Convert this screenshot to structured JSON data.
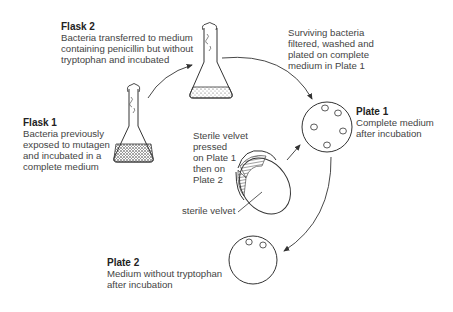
{
  "flask2": {
    "title": "Flask 2",
    "lines": [
      "Bacteria transferred to medium",
      "containing penicillin but without",
      "tryptophan and incubated"
    ]
  },
  "surviving": {
    "lines": [
      "Surviving bacteria",
      "filtered, washed and",
      "plated on complete",
      "medium in Plate 1"
    ]
  },
  "flask1": {
    "title": "Flask 1",
    "lines": [
      "Bacteria previously",
      "exposed to mutagen",
      "and incubated in a",
      "complete medium"
    ]
  },
  "velvet_step": {
    "lines": [
      "Sterile velvet",
      "pressed",
      "on Plate 1",
      "then on",
      "Plate 2"
    ]
  },
  "velvet_label": "sterile velvet",
  "plate1": {
    "title": "Plate 1",
    "lines": [
      "Complete medium",
      "after incubation"
    ],
    "colonies": 5
  },
  "plate2": {
    "title": "Plate 2",
    "lines": [
      "Medium without tryptophan",
      "after incubation"
    ],
    "colonies": 2
  }
}
